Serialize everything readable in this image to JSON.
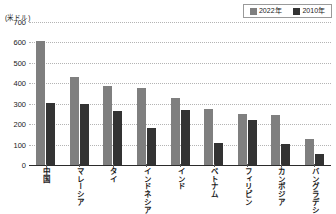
{
  "unit_label": "(米ドル)",
  "legend": {
    "position": "top-right",
    "entries": [
      {
        "label": "2022年",
        "color": "#7f7f7f",
        "swatch": "legend-swatch-2022"
      },
      {
        "label": "2010年",
        "color": "#333333",
        "swatch": "legend-swatch-2010"
      }
    ]
  },
  "axis": {
    "y_ticks": [
      "700",
      "600",
      "500",
      "400",
      "300",
      "200",
      "100",
      "0"
    ]
  },
  "chart_data": {
    "type": "bar",
    "title": "",
    "subtitle": "",
    "xlabel": "",
    "ylabel": "(米ドル)",
    "ylim": [
      0,
      700
    ],
    "ytick_step": 100,
    "grid": true,
    "legend_position": "top-right",
    "categories": [
      "中国",
      "マレーシア",
      "タイ",
      "インドネシア",
      "インド",
      "ベトナム",
      "フィリピン",
      "カンボジア",
      "バングラデシュ"
    ],
    "series": [
      {
        "name": "2022年",
        "color": "#7f7f7f",
        "values": [
          605,
          430,
          388,
          378,
          328,
          275,
          250,
          247,
          125
        ]
      },
      {
        "name": "2010年",
        "color": "#333333",
        "values": [
          305,
          300,
          262,
          182,
          270,
          110,
          218,
          105,
          52
        ]
      }
    ]
  }
}
